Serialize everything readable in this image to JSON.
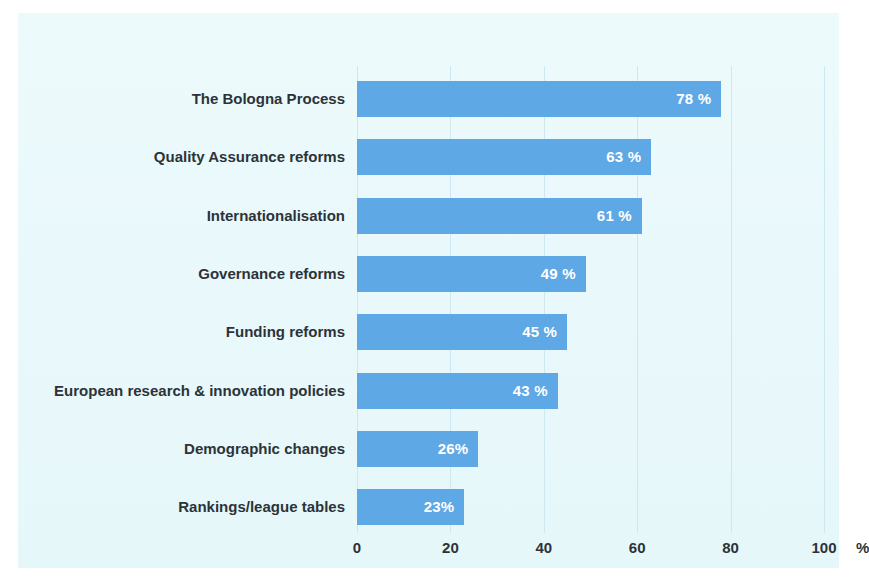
{
  "chart_data": {
    "type": "bar",
    "orientation": "horizontal",
    "title": "",
    "subtitle": "",
    "xlabel": "",
    "ylabel": "",
    "unit": "%",
    "xlim": [
      0,
      100
    ],
    "grid": true,
    "legend": null,
    "categories": [
      "The Bologna Process",
      "Quality Assurance reforms",
      "Internationalisation",
      "Governance reforms",
      "Funding reforms",
      "European research & innovation policies",
      "Demographic changes",
      "Rankings/league tables"
    ],
    "values": [
      78,
      63,
      61,
      49,
      45,
      43,
      26,
      23
    ],
    "value_labels": [
      "78 %",
      "63 %",
      "61 %",
      "49 %",
      "45 %",
      "43 %",
      "26%",
      "23%"
    ],
    "xticks": [
      0,
      20,
      40,
      60,
      80,
      100
    ],
    "xtick_labels": [
      "0",
      "20",
      "40",
      "60",
      "80",
      "100"
    ],
    "axis_unit_label": "%",
    "colors": {
      "bar": "#5fa8e6",
      "bar_label_text": "#ffffff",
      "category_label_text": "#2c3338",
      "tick_label_text": "#2c3338",
      "gridline": "#cfe8ef",
      "panel_background": "#eaf9fb",
      "page_background": "#ffffff"
    }
  }
}
